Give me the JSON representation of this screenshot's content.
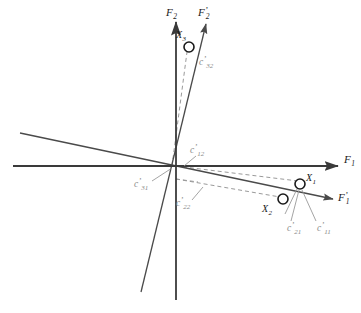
{
  "figure": {
    "type": "vector-diagram",
    "width": 361,
    "height": 313,
    "background_color": "#ffffff"
  },
  "colors": {
    "axis": "#3a3a3a",
    "oblique_axis": "#4a4a4a",
    "dashed_projection": "#9a9a9a",
    "leader_line": "#9a9a9a",
    "label_text": "#1a1a1a",
    "coefficient_text": "#8a8a8a",
    "point_marker_stroke": "#1a1a1a",
    "point_marker_fill": "#ffffff"
  },
  "axes": [
    {
      "id": "F1",
      "name": "horizontal-reference-axis",
      "label_base": "F",
      "label_sub": "1",
      "prime": false,
      "label_text": "F1",
      "style": "solid",
      "arrow": true,
      "x1": 13,
      "y1": 166,
      "x2": 338,
      "y2": 166,
      "label_x": 344,
      "label_y": 163
    },
    {
      "id": "F2",
      "name": "vertical-reference-axis",
      "label_base": "F",
      "label_sub": "2",
      "prime": false,
      "label_text": "F2",
      "style": "solid",
      "arrow": true,
      "x1": 176,
      "y1": 300,
      "x2": 176,
      "y2": 22,
      "label_x": 169,
      "label_y": 16
    },
    {
      "id": "F1p",
      "name": "oblique-factor-axis-1",
      "label_base": "F",
      "label_sub": "1",
      "prime": true,
      "label_text": "F'1",
      "style": "solid",
      "arrow": true,
      "x1": 20,
      "y1": 133,
      "x2": 333,
      "y2": 199,
      "label_x": 338,
      "label_y": 199
    },
    {
      "id": "F2p",
      "name": "oblique-factor-axis-2",
      "label_base": "F",
      "label_sub": "2",
      "prime": true,
      "label_text": "F'2",
      "style": "solid",
      "arrow": true,
      "x1": 141,
      "y1": 292,
      "x2": 206,
      "y2": 24,
      "label_x": 200,
      "label_y": 16
    }
  ],
  "origin": {
    "x": 176,
    "y": 166
  },
  "points": [
    {
      "id": "X1",
      "name": "variable-point-1",
      "label_base": "X",
      "label_sub": "1",
      "label_text": "X1",
      "cx": 300,
      "cy": 184,
      "r": 5,
      "label_x": 308,
      "label_y": 181
    },
    {
      "id": "X2",
      "name": "variable-point-2",
      "label_base": "X",
      "label_sub": "2",
      "label_text": "X2",
      "cx": 283,
      "cy": 199,
      "r": 5,
      "label_x": 264,
      "label_y": 211
    },
    {
      "id": "X3",
      "name": "variable-point-3",
      "label_base": "X",
      "label_sub": "3",
      "label_text": "X3",
      "cx": 189,
      "cy": 47,
      "r": 5,
      "label_x": 178,
      "label_y": 37
    }
  ],
  "projection_lines": [
    {
      "id": "proj-X1",
      "name": "dashed-projection-origin-to-x1",
      "from_x": 176,
      "from_y": 166,
      "to_x": 298,
      "to_y": 181
    },
    {
      "id": "proj-X2",
      "name": "dashed-projection-origin-to-x2",
      "from_x": 176,
      "from_y": 179,
      "to_x": 280,
      "to_y": 197
    },
    {
      "id": "proj-X3",
      "name": "dashed-projection-origin-to-x3",
      "from_x": 172,
      "from_y": 166,
      "to_x": 187,
      "to_y": 52
    }
  ],
  "coefficients": [
    {
      "id": "c11",
      "name": "coefficient-c11",
      "label_base": "c",
      "label_sub": "11",
      "label_text": "c'11",
      "prime": true,
      "label_x": 318,
      "label_y": 229,
      "leader": {
        "x1": 316,
        "y1": 221,
        "x2": 302,
        "y2": 190
      }
    },
    {
      "id": "c12",
      "name": "coefficient-c12",
      "label_base": "c",
      "label_sub": "12",
      "label_text": "c'12",
      "prime": true,
      "label_x": 190,
      "label_y": 152,
      "leader": {
        "x1": 196,
        "y1": 156,
        "x2": 184,
        "y2": 166
      }
    },
    {
      "id": "c21",
      "name": "coefficient-c21",
      "label_base": "c",
      "label_sub": "21",
      "label_text": "c'21",
      "prime": true,
      "label_x": 289,
      "label_y": 229,
      "leader": {
        "x1": 291,
        "y1": 221,
        "x2": 299,
        "y2": 190
      }
    },
    {
      "id": "c22",
      "name": "coefficient-c22",
      "label_base": "c",
      "label_sub": "22",
      "label_text": "c'22",
      "prime": true,
      "label_x": 179,
      "label_y": 204,
      "leader": {
        "x1": 192,
        "y1": 200,
        "x2": 203,
        "y2": 187
      }
    },
    {
      "id": "c31",
      "name": "coefficient-c31",
      "label_base": "c",
      "label_sub": "31",
      "label_text": "c'31",
      "prime": true,
      "label_x": 137,
      "label_y": 186,
      "leader": {
        "x1": 152,
        "y1": 181,
        "x2": 172,
        "y2": 168
      }
    },
    {
      "id": "c32",
      "name": "coefficient-c32",
      "label_base": "c",
      "label_sub": "32",
      "label_text": "c'32",
      "prime": true,
      "label_x": 200,
      "label_y": 63,
      "leader": null
    }
  ]
}
